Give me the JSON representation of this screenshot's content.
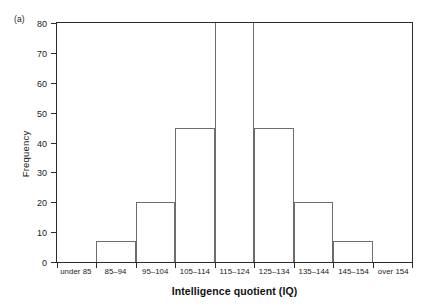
{
  "figure": {
    "panel_label": "(a)"
  },
  "chart_data": {
    "type": "bar",
    "title": "",
    "subtitle": "",
    "xlabel": "Intelligence quotient (IQ)",
    "ylabel": "Frequency",
    "categories": [
      "under 85",
      "85–94",
      "95–104",
      "105–114",
      "115–124",
      "125–134",
      "135–144",
      "145–154",
      "over 154"
    ],
    "values": [
      0,
      7,
      20,
      45,
      80,
      45,
      20,
      7,
      0
    ],
    "value_notes": [
      "bar absent at zero",
      "",
      "",
      "",
      "bar extends to or beyond the top of the axis (clipped at 80)",
      "",
      "",
      "",
      "bar absent at zero"
    ],
    "ylim": [
      0,
      80
    ],
    "yticks": [
      0,
      10,
      20,
      30,
      40,
      50,
      60,
      70,
      80
    ],
    "ytick_labels": [
      "0",
      "10",
      "20",
      "30",
      "40",
      "50",
      "60",
      "70",
      "80"
    ],
    "grid": false,
    "legend": false,
    "legend_position": "none",
    "bar_style": "outlined, unfilled",
    "colors": {
      "bar_outline": "#6d6d6d",
      "axis": "#2b2b2b",
      "text": "#1a1a1a",
      "background": "#ffffff"
    }
  }
}
